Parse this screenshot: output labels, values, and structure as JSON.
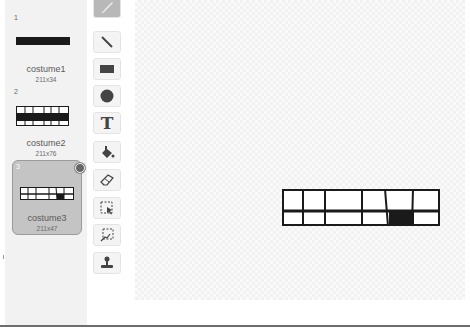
{
  "costumes": [
    {
      "number": "1",
      "name": "costume1",
      "size": "211x34",
      "selected": false
    },
    {
      "number": "2",
      "name": "costume2",
      "size": "211x76",
      "selected": false
    },
    {
      "number": "3",
      "name": "costume3",
      "size": "211x47",
      "selected": true
    }
  ],
  "tools": [
    {
      "name": "brush",
      "icon": "brush-icon",
      "active": true
    },
    {
      "name": "line",
      "icon": "line-icon",
      "active": false
    },
    {
      "name": "rectangle",
      "icon": "rectangle-icon",
      "active": false
    },
    {
      "name": "ellipse",
      "icon": "ellipse-icon",
      "active": false
    },
    {
      "name": "text",
      "icon": "text-icon",
      "active": false,
      "glyph": "T"
    },
    {
      "name": "fill",
      "icon": "paint-bucket-icon",
      "active": false
    },
    {
      "name": "eraser",
      "icon": "eraser-icon",
      "active": false
    },
    {
      "name": "select",
      "icon": "select-icon",
      "active": false
    },
    {
      "name": "reshape",
      "icon": "select-and-duplicate-icon",
      "active": false
    },
    {
      "name": "stamp",
      "icon": "stamp-icon",
      "active": false
    }
  ],
  "colors": {
    "sidebar_bg": "#f2f2f2",
    "selected_bg": "#c4c4c4",
    "icon": "#444444",
    "ink": "#1a1a1a"
  }
}
